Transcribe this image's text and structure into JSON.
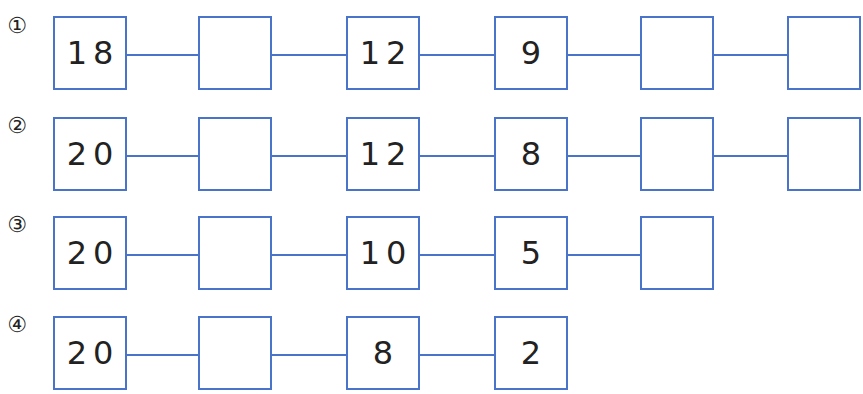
{
  "worksheet": {
    "accent_color": "#4a74c9",
    "problems": [
      {
        "label": "①",
        "boxes": [
          "18",
          "",
          "12",
          "9",
          "",
          ""
        ]
      },
      {
        "label": "②",
        "boxes": [
          "20",
          "",
          "12",
          "8",
          "",
          ""
        ]
      },
      {
        "label": "③",
        "boxes": [
          "20",
          "",
          "10",
          "5",
          ""
        ]
      },
      {
        "label": "④",
        "boxes": [
          "20",
          "",
          "8",
          "2"
        ]
      }
    ]
  }
}
